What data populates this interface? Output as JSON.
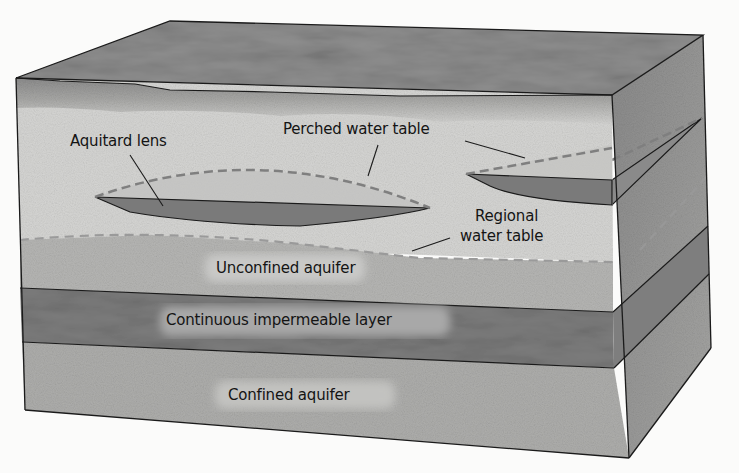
{
  "diagram": {
    "type": "geologic block diagram (cross-section)",
    "labels": {
      "aquitard_lens": "Aquitard lens",
      "perched_water_table": "Perched water table",
      "regional_water_table_line1": "Regional",
      "regional_water_table_line2": "water table",
      "unconfined_aquifer": "Unconfined aquifer",
      "impermeable_layer": "Continuous impermeable layer",
      "confined_aquifer": "Confined aquifer"
    },
    "layers_top_to_bottom": [
      "Soil surface",
      "Unsaturated zone",
      "Unconfined aquifer",
      "Continuous impermeable layer",
      "Confined aquifer"
    ],
    "colors": {
      "background": "#fbfbfa",
      "top_surface": "#8f8f8f",
      "soil_band": "#9a9a9a",
      "unsaturated_zone": "#d6d6d4",
      "unconfined_aquifer": "#b6b6b4",
      "impermeable_layer": "#7e7e7e",
      "confined_aquifer": "#aeaeac",
      "aquitard_lens": "#7a7a7a",
      "perched_water_zone": "#bdbdbb",
      "side_face": "#9c9c9c",
      "dashed_line": "#8a8a8a",
      "outline": "#1a1a1a"
    }
  }
}
